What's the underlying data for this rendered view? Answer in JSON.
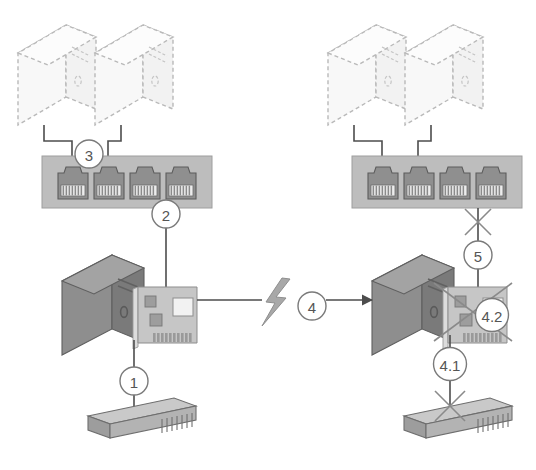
{
  "diagram": {
    "background_color": "#ffffff",
    "callouts": [
      {
        "id": "callout-1",
        "label": "1",
        "cx": 134,
        "cy": 381,
        "r": 14,
        "font_size": 15
      },
      {
        "id": "callout-2",
        "label": "2",
        "cx": 166,
        "cy": 214,
        "r": 14,
        "font_size": 15
      },
      {
        "id": "callout-3",
        "label": "3",
        "cx": 89,
        "cy": 154,
        "r": 14,
        "font_size": 15
      },
      {
        "id": "callout-4",
        "label": "4",
        "cx": 312,
        "cy": 306,
        "r": 14,
        "font_size": 15
      },
      {
        "id": "callout-5",
        "label": "5",
        "cx": 478,
        "cy": 255,
        "r": 14,
        "font_size": 15
      },
      {
        "id": "callout-4-1",
        "label": "4.1",
        "cx": 450,
        "cy": 364,
        "r": 16.5,
        "font_size": 15
      },
      {
        "id": "callout-4-2",
        "label": "4.2",
        "cx": 492,
        "cy": 315,
        "r": 16.5,
        "font_size": 15
      }
    ],
    "ghost_workstations": [
      {
        "id": "ghost-pc-top-left-1",
        "x": 18,
        "y": 25
      },
      {
        "id": "ghost-pc-top-left-2",
        "x": 95,
        "y": 25
      },
      {
        "id": "ghost-pc-top-right-1",
        "x": 328,
        "y": 25
      },
      {
        "id": "ghost-pc-top-right-2",
        "x": 405,
        "y": 25
      }
    ],
    "patch_panels": [
      {
        "id": "patch-panel-left",
        "x": 42,
        "y": 156,
        "width": 170,
        "height": 52,
        "ports": 4
      },
      {
        "id": "patch-panel-right",
        "x": 352,
        "y": 156,
        "width": 170,
        "height": 52,
        "ports": 4
      }
    ],
    "servers": [
      {
        "id": "server-left",
        "x": 62,
        "y": 255,
        "nic": true,
        "nic_crossed_out": false
      },
      {
        "id": "server-right",
        "x": 372,
        "y": 255,
        "nic": true,
        "nic_crossed_out": true
      }
    ],
    "wall_outlets": [
      {
        "id": "wall-outlet-left",
        "x": 88,
        "y": 398
      },
      {
        "id": "wall-outlet-right",
        "x": 404,
        "y": 398
      }
    ],
    "lightning_bolt": {
      "id": "fault-bolt",
      "cx": 277,
      "cy": 306
    },
    "cross_marks": [
      {
        "id": "cross-mark-panel-right",
        "cx": 478,
        "cy": 222,
        "size": 13
      },
      {
        "id": "cross-mark-outlet-right",
        "cx": 450,
        "cy": 406,
        "size": 15
      }
    ],
    "colors": {
      "server_body": "#8c8c8c",
      "server_top": "#a6a6a6",
      "server_side": "#6e6e6e",
      "panel_fill": "#bdbdbd",
      "port_fill": "#8f8f8f",
      "cable_stroke": "#4d4d4d",
      "callout_stroke": "#7a7a7a",
      "callout_text": "#555555",
      "ghost_stroke": "#b9b9b9",
      "ghost_fill": "#f7f7f7",
      "bolt_fill": "#a8a8a8",
      "cross_stroke": "#8a8a8a",
      "nic_fill": "#c4c4c4"
    }
  }
}
